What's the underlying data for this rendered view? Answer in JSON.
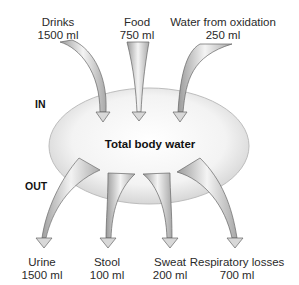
{
  "diagram": {
    "title": "Total body water",
    "sections": {
      "in": "IN",
      "out": "OUT"
    },
    "inputs": [
      {
        "name": "Drinks",
        "amount": "1500 ml"
      },
      {
        "name": "Food",
        "amount": "750 ml"
      },
      {
        "name": "Water from oxidation",
        "amount": "250 ml"
      }
    ],
    "outputs": [
      {
        "name": "Urine",
        "amount": "1500 ml"
      },
      {
        "name": "Stool",
        "amount": "100 ml"
      },
      {
        "name": "Sweat",
        "amount": "200 ml"
      },
      {
        "name": "Respiratory losses",
        "amount": "700 ml"
      }
    ],
    "colors": {
      "arrow_dark": "#8c8c8c",
      "arrow_light": "#f2f2f2",
      "ellipse_edge": "#bdbdbd",
      "ellipse_fill": "#ececec",
      "outline": "#555555"
    }
  }
}
